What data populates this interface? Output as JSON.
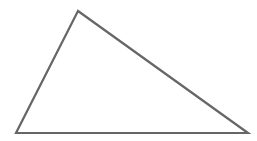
{
  "diagram": {
    "shape": "triangle",
    "width": 257,
    "height": 141,
    "background": "#ffffff",
    "stroke_color": "#666666",
    "stroke_width": 2.2,
    "fill": "none",
    "vertices": {
      "apex": {
        "x": 78,
        "y": 11
      },
      "bottom_left": {
        "x": 16,
        "y": 133
      },
      "bottom_right": {
        "x": 248,
        "y": 133
      }
    }
  }
}
